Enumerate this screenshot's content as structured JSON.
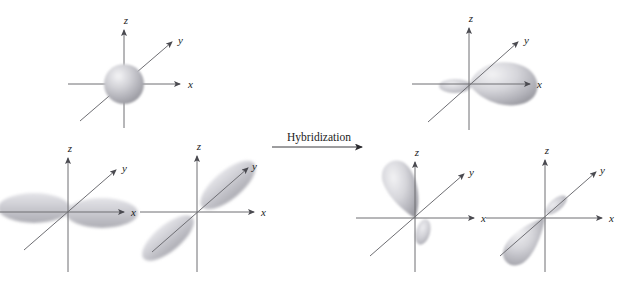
{
  "figure": {
    "background_color": "#ffffff",
    "width": 628,
    "height": 283,
    "axis_color": "#6e6e73",
    "axis_label_color": "#1b1b1b",
    "orbital_fill_light": "#e8e8ea",
    "orbital_fill_mid": "#bdbdc2",
    "orbital_fill_dark": "#8e8e96",
    "sphere_fill_light": "#f0f0f2",
    "sphere_fill_dark": "#a9a9b0"
  },
  "process_arrow": {
    "label": "Hybridization",
    "direction": "left-to-right",
    "icon": "right-arrow-icon"
  },
  "axis_labels": {
    "x": "x",
    "y": "y",
    "z": "z"
  },
  "panels": [
    {
      "id": "panel-s-orbital",
      "side": "left",
      "orbital_name": "s orbital",
      "shape": "sphere",
      "axes": [
        "x",
        "y",
        "z"
      ],
      "labels": {
        "x": "x",
        "y": "y",
        "z": "z"
      }
    },
    {
      "id": "panel-px-orbital",
      "side": "left",
      "orbital_name": "p_x orbital",
      "shape": "two-lobes-along-x",
      "axes": [
        "x",
        "y",
        "z"
      ],
      "labels": {
        "x": "x",
        "y": "y",
        "z": "z"
      }
    },
    {
      "id": "panel-py-orbital",
      "side": "left",
      "orbital_name": "p_y orbital",
      "shape": "two-lobes-along-y",
      "axes": [
        "x",
        "y",
        "z"
      ],
      "labels": {
        "x": "x",
        "y": "y",
        "z": "z"
      }
    },
    {
      "id": "panel-hybrid-1",
      "side": "right",
      "orbital_name": "hybrid orbital 1",
      "shape": "teardrop-along-plus-x",
      "axes": [
        "x",
        "y",
        "z"
      ],
      "labels": {
        "x": "x",
        "y": "y",
        "z": "z"
      }
    },
    {
      "id": "panel-hybrid-2",
      "side": "right",
      "orbital_name": "hybrid orbital 2",
      "shape": "teardrop-upper-left",
      "axes": [
        "x",
        "y",
        "z"
      ],
      "labels": {
        "x": "x",
        "y": "y",
        "z": "z"
      }
    },
    {
      "id": "panel-hybrid-3",
      "side": "right",
      "orbital_name": "hybrid orbital 3",
      "shape": "teardrop-lower-left",
      "axes": [
        "x",
        "y",
        "z"
      ],
      "labels": {
        "x": "x",
        "y": "y",
        "z": "z"
      }
    }
  ]
}
